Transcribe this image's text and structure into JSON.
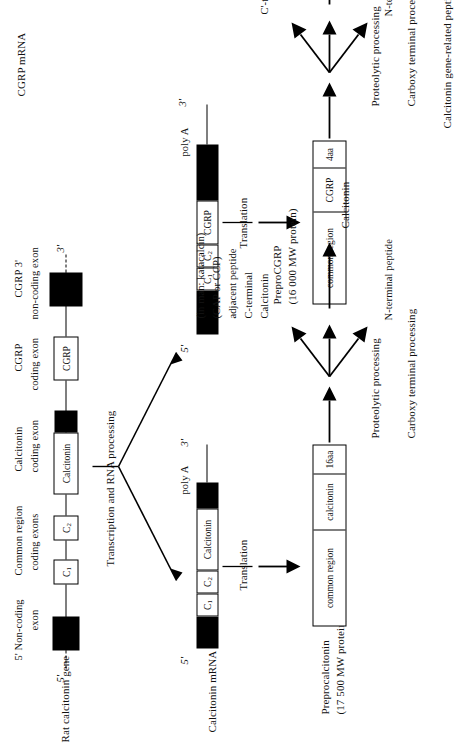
{
  "figure": {
    "caption_rows": {
      "gene": "Rat calcitonin gene",
      "mrna_calcitonin": "Calcitonin mRNA",
      "mrna_cgrp": "CGRP mRNA",
      "protein_calcitonin": "Preprocalcitonin",
      "protein_calcitonin_mw": "(17 500 MW protein)",
      "protein_cgrp": "PreproCGRP",
      "protein_cgrp_mw": "(16 000 MW protein)"
    },
    "gene": {
      "headers": [
        "5' Non-coding",
        "exon",
        "Common region",
        "coding exons",
        "Calcitonin",
        "coding exon",
        "CGRP",
        "coding exon",
        "CGRP 3'",
        "non-coding exon"
      ],
      "five_prime": "5'",
      "three_prime": "3'",
      "exons": [
        {
          "label": "",
          "type": "black"
        },
        {
          "label": "C1",
          "type": "open"
        },
        {
          "label": "C2",
          "type": "open"
        },
        {
          "label": "Calcitonin",
          "type": "open"
        },
        {
          "label": "",
          "type": "black"
        },
        {
          "label": "CGRP",
          "type": "open"
        },
        {
          "label": "",
          "type": "black"
        }
      ]
    },
    "processing_label": "Transcription and RNA processing",
    "mrna_calcitonin": {
      "five_prime": "5'",
      "three_prime": "3'",
      "poly_a": "poly A",
      "segments": [
        {
          "label": "",
          "type": "black"
        },
        {
          "label": "C1",
          "type": "open"
        },
        {
          "label": "C2",
          "type": "open"
        },
        {
          "label": "Calcitonin",
          "type": "open"
        },
        {
          "label": "",
          "type": "black"
        }
      ]
    },
    "mrna_cgrp": {
      "five_prime": "5'",
      "three_prime": "3'",
      "poly_a": "poly A",
      "segments": [
        {
          "label": "",
          "type": "black"
        },
        {
          "label": "C1",
          "type": "open"
        },
        {
          "label": "C2",
          "type": "open"
        },
        {
          "label": "CGRP",
          "type": "open"
        },
        {
          "label": "",
          "type": "black"
        }
      ]
    },
    "translation_label": "Translation",
    "protein_calcitonin_segments": [
      "common region",
      "calcitonin",
      "16aa"
    ],
    "protein_cgrp_segments": [
      "common region",
      "CGRP",
      "4aa"
    ],
    "proteolytic_label": "Proteolytic processing",
    "carboxy_label": "Carboxy terminal processing",
    "calcitonin_branch": {
      "up": [
        "Calcitonin",
        "C-terminal",
        "adjacent peptide",
        "(CAP or CCP)",
        "(in man: katacalcin)"
      ],
      "down": "N-terminal peptide",
      "product": "Calcitonin"
    },
    "cgrp_branch": {
      "up": "C'-terminal peptide",
      "down": "N-terminal peptide",
      "product": "Calcitonin gene-related peptide (CGRP)"
    }
  },
  "colors": {
    "ink": "#111111",
    "exon_fill": "#000000",
    "background": "#ffffff"
  }
}
